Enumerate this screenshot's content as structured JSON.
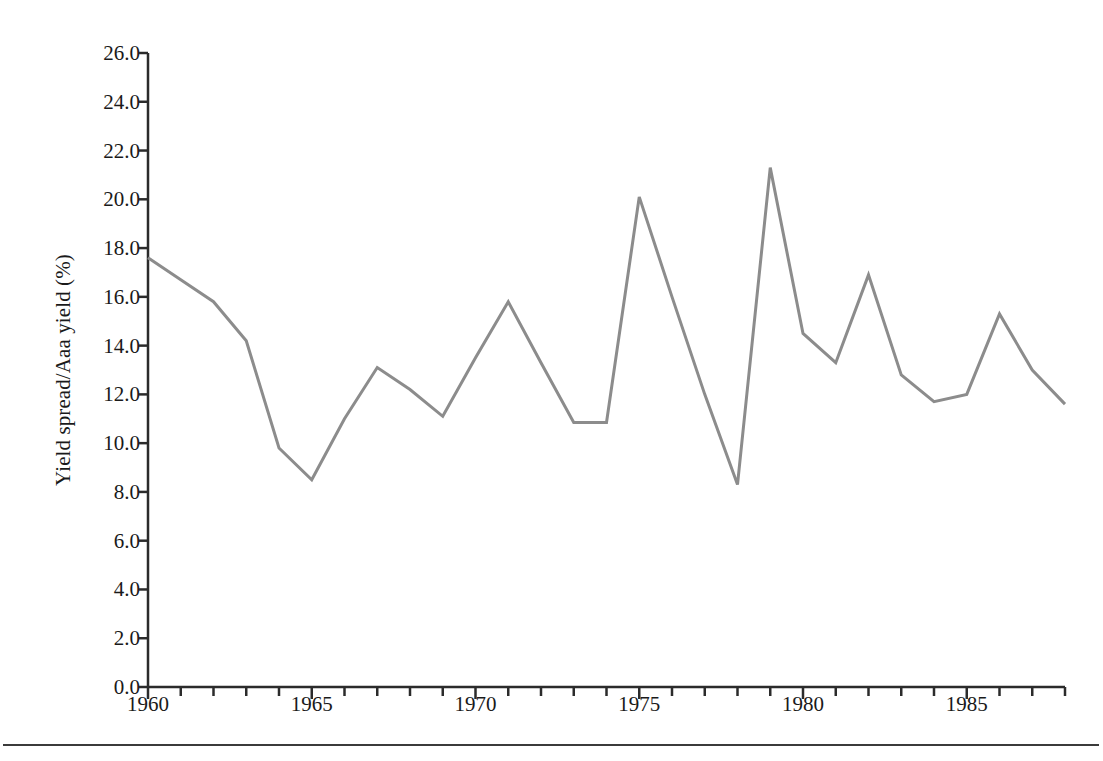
{
  "figure": {
    "background_color": "#ffffff",
    "axis_color": "#2b2b2b",
    "line_color": "#8c8c8c",
    "text_color": "#1a1a1a",
    "bottom_rule": true
  },
  "axes": {
    "ylabel": "Yield spread/Aaa yield (%)",
    "xlabel": "",
    "ytick_labels": [
      "0.0",
      "2.0",
      "4.0",
      "6.0",
      "8.0",
      "10.0",
      "12.0",
      "14.0",
      "16.0",
      "18.0",
      "20.0",
      "22.0",
      "24.0",
      "26.0"
    ],
    "xtick_labels": [
      "1960",
      "1965",
      "1970",
      "1975",
      "1980",
      "1985"
    ]
  },
  "chart_data": {
    "type": "line",
    "title": "",
    "xlabel": "",
    "ylabel": "Yield spread/Aaa yield (%)",
    "xlim": [
      1960,
      1988
    ],
    "ylim": [
      0.0,
      26.0
    ],
    "ytick_values": [
      0.0,
      2.0,
      4.0,
      6.0,
      8.0,
      10.0,
      12.0,
      14.0,
      16.0,
      18.0,
      20.0,
      22.0,
      24.0,
      26.0
    ],
    "xtick_values": [
      1960,
      1965,
      1970,
      1975,
      1980,
      1985
    ],
    "xminor_tick_step": 1,
    "grid": false,
    "legend": false,
    "series": [
      {
        "name": "Yield spread/Aaa yield",
        "color": "#8c8c8c",
        "x": [
          1960,
          1961,
          1962,
          1963,
          1964,
          1965,
          1966,
          1967,
          1968,
          1969,
          1970,
          1971,
          1972,
          1973,
          1974,
          1975,
          1976,
          1977,
          1978,
          1979,
          1980,
          1981,
          1982,
          1983,
          1984,
          1985,
          1986,
          1987,
          1988
        ],
        "values": [
          17.6,
          16.7,
          15.8,
          14.2,
          9.8,
          8.5,
          11.0,
          13.1,
          12.2,
          11.1,
          13.5,
          15.8,
          13.3,
          10.85,
          10.85,
          20.1,
          16.0,
          12.0,
          8.3,
          21.3,
          14.5,
          13.3,
          16.9,
          12.8,
          11.7,
          12.0,
          15.3,
          13.0,
          11.6
        ]
      }
    ]
  }
}
